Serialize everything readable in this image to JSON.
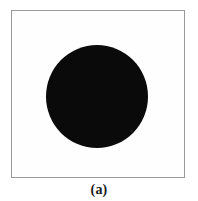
{
  "figure": {
    "caption": "(a)",
    "frame": {
      "border_color": "#9a9a9a",
      "background_color": "#fdfdfd",
      "left": 11,
      "top": 10,
      "width": 174,
      "height": 168
    },
    "shape": {
      "kind": "filled-circle",
      "color": "#0a0a0a",
      "center_x": 85,
      "center_y": 85,
      "diameter": 102
    },
    "page_background": "#ffffff"
  }
}
